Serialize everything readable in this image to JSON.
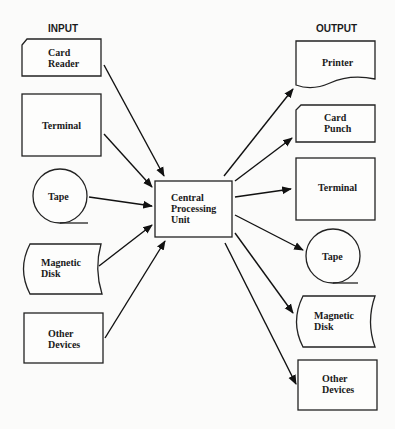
{
  "diagram": {
    "headers": {
      "input": "INPUT",
      "output": "OUTPUT"
    },
    "center": {
      "line1": "Central",
      "line2": "Processing",
      "line3": "Unit"
    },
    "inputs": [
      {
        "shape": "punched-card",
        "line1": "Card",
        "line2": "Reader"
      },
      {
        "shape": "rectangle",
        "line1": "Terminal",
        "line2": ""
      },
      {
        "shape": "tape-circle",
        "line1": "Tape",
        "line2": ""
      },
      {
        "shape": "disk",
        "line1": "Magnetic",
        "line2": "Disk"
      },
      {
        "shape": "rectangle",
        "line1": "Other",
        "line2": "Devices"
      }
    ],
    "outputs": [
      {
        "shape": "document",
        "line1": "Printer",
        "line2": ""
      },
      {
        "shape": "punched-card",
        "line1": "Card",
        "line2": "Punch"
      },
      {
        "shape": "rectangle",
        "line1": "Terminal",
        "line2": ""
      },
      {
        "shape": "tape-circle",
        "line1": "Tape",
        "line2": ""
      },
      {
        "shape": "disk",
        "line1": "Magnetic",
        "line2": "Disk"
      },
      {
        "shape": "rectangle",
        "line1": "Other",
        "line2": "Devices"
      }
    ],
    "edges": [
      {
        "from": "Card Reader",
        "to": "Central Processing Unit"
      },
      {
        "from": "Terminal",
        "to": "Central Processing Unit"
      },
      {
        "from": "Tape",
        "to": "Central Processing Unit"
      },
      {
        "from": "Magnetic Disk",
        "to": "Central Processing Unit"
      },
      {
        "from": "Other Devices",
        "to": "Central Processing Unit"
      },
      {
        "from": "Central Processing Unit",
        "to": "Printer"
      },
      {
        "from": "Central Processing Unit",
        "to": "Card Punch"
      },
      {
        "from": "Central Processing Unit",
        "to": "Terminal"
      },
      {
        "from": "Central Processing Unit",
        "to": "Tape"
      },
      {
        "from": "Central Processing Unit",
        "to": "Magnetic Disk"
      },
      {
        "from": "Central Processing Unit",
        "to": "Other Devices"
      }
    ]
  }
}
